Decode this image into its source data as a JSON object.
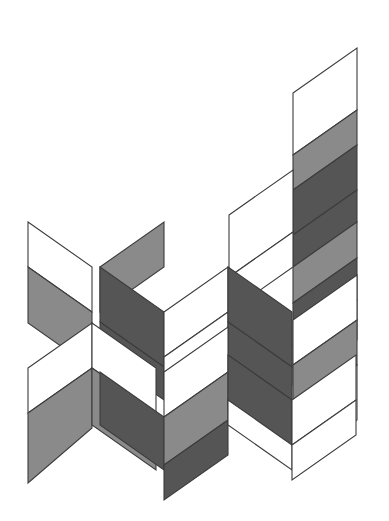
{
  "figure": {
    "canvas": {
      "width": 389,
      "height": 521,
      "background": "#ffffff"
    },
    "palette": {
      "white": "#ffffff",
      "medium_gray": "#8a8a8a",
      "dark_gray": "#555555",
      "outline": "#3c3c3c"
    },
    "faces": [
      {
        "name": "top-ribbon-upper-white",
        "tone": "white",
        "points": "293,93 357,48 357,110 293,155"
      },
      {
        "name": "top-ribbon-mid-gray",
        "tone": "medium_gray",
        "points": "293,155 357,110 357,145 293,190"
      },
      {
        "name": "top-ribbon-fold-dark",
        "tone": "dark_gray",
        "points": "293,190 357,145 357,190 293,235"
      },
      {
        "name": "top-ribbon-lower-dark",
        "tone": "dark_gray",
        "points": "293,235 357,190 357,222 293,267"
      },
      {
        "name": "top-ribbon-foot-gray",
        "tone": "medium_gray",
        "points": "293,267 357,222 357,258 293,303"
      },
      {
        "name": "right-upper-white-panel",
        "tone": "white",
        "points": "229,215 293,170 293,232 229,277"
      },
      {
        "name": "right-upper-white-lower",
        "tone": "white",
        "points": "229,277 293,232 293,267 229,312"
      },
      {
        "name": "right-mid-dark-ribbon",
        "tone": "dark_gray",
        "points": "293,303 357,258 357,300 293,345"
      },
      {
        "name": "right-mid-gray-ribbon",
        "tone": "medium_gray",
        "points": "293,345 357,300 357,340 293,385"
      },
      {
        "name": "right-outer-white-top",
        "tone": "white",
        "points": "293,320 357,275 357,320 293,365"
      },
      {
        "name": "right-outer-gray",
        "tone": "medium_gray",
        "points": "293,365 357,320 357,365 293,410"
      },
      {
        "name": "right-outer-white-bottom",
        "tone": "white",
        "points": "293,410 357,365 357,420 293,465"
      },
      {
        "name": "left-top-white-panel",
        "tone": "white",
        "points": "28,222 92,267 92,312 28,267"
      },
      {
        "name": "left-top-gray-panel",
        "tone": "medium_gray",
        "points": "28,267 92,312 92,368 28,323"
      },
      {
        "name": "left-upper-gray-wing",
        "tone": "medium_gray",
        "points": "100,267 164,222 164,267 100,312"
      },
      {
        "name": "left-upper-dark-wing",
        "tone": "dark_gray",
        "points": "100,267 164,312 164,367 100,322"
      },
      {
        "name": "center-dark-ribbon",
        "tone": "dark_gray",
        "points": "100,322 164,367 164,400 100,355"
      },
      {
        "name": "center-white-top",
        "tone": "white",
        "points": "164,312 228,267 228,312 164,357"
      },
      {
        "name": "center-white-lower",
        "tone": "white",
        "points": "164,357 228,312 228,347 164,392"
      },
      {
        "name": "center-right-dark",
        "tone": "dark_gray",
        "points": "228,267 292,312 292,367 228,322"
      },
      {
        "name": "center-right-dark-low",
        "tone": "dark_gray",
        "points": "228,322 292,367 292,400 228,355"
      },
      {
        "name": "lower-left-white-wing",
        "tone": "white",
        "points": "28,368 92,323 92,368 28,413"
      },
      {
        "name": "lower-left-gray-wing",
        "tone": "medium_gray",
        "points": "28,413 92,368 92,428 28,483"
      },
      {
        "name": "lower-mid-white-top",
        "tone": "white",
        "points": "92,323 156,368 156,413 92,368"
      },
      {
        "name": "lower-mid-gray-face",
        "tone": "medium_gray",
        "points": "92,368 156,413 156,470 92,425"
      },
      {
        "name": "bowl-left-dark-face",
        "tone": "dark_gray",
        "points": "100,372 164,417 164,470 100,425"
      },
      {
        "name": "bowl-inner-white",
        "tone": "white",
        "points": "164,372 228,327 228,372 164,417"
      },
      {
        "name": "bowl-floor-gray",
        "tone": "medium_gray",
        "points": "164,417 228,372 228,420 164,465"
      },
      {
        "name": "bowl-right-dark",
        "tone": "dark_gray",
        "points": "164,465 228,420 228,455 164,500"
      },
      {
        "name": "lower-right-dark-wing",
        "tone": "dark_gray",
        "points": "228,355 292,400 292,455 228,410"
      },
      {
        "name": "lower-right-white-wing",
        "tone": "white",
        "points": "228,400 292,445 292,470 228,425"
      },
      {
        "name": "far-right-white-wing",
        "tone": "white",
        "points": "292,400 356,355 356,400 292,445"
      },
      {
        "name": "far-right-white-low",
        "tone": "white",
        "points": "292,445 356,400 356,435 292,480"
      }
    ],
    "accessibility": {
      "alt_text": "Abstract isometric drawing of interlocking stepped ribbons made of shaded parallelograms"
    }
  }
}
